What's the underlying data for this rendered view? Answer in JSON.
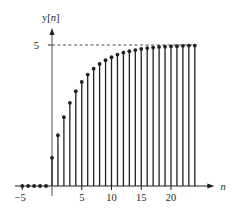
{
  "chart_data": {
    "type": "stem",
    "title": "",
    "ylabel": "y[n]",
    "xlabel": "n",
    "x_ticks": [
      -5,
      5,
      10,
      15,
      20
    ],
    "y_ticks": [
      5
    ],
    "asymptote": 5,
    "xlim": [
      -6,
      27
    ],
    "ylim": [
      0,
      5.6
    ],
    "grid": false,
    "x": [
      -5,
      -4,
      -3,
      -2,
      -1,
      0,
      1,
      2,
      3,
      4,
      5,
      6,
      7,
      8,
      9,
      10,
      11,
      12,
      13,
      14,
      15,
      16,
      17,
      18,
      19,
      20,
      21,
      22,
      23,
      24
    ],
    "values": [
      0,
      0,
      0,
      0,
      0,
      1.0,
      1.8,
      2.44,
      2.95,
      3.36,
      3.69,
      3.95,
      4.16,
      4.33,
      4.46,
      4.57,
      4.66,
      4.73,
      4.78,
      4.82,
      4.86,
      4.89,
      4.91,
      4.93,
      4.94,
      4.95,
      4.96,
      4.97,
      4.98,
      4.98
    ]
  },
  "labels": {
    "y_axis": "y[n]",
    "x_axis": "n",
    "y_tick_5": "5"
  }
}
